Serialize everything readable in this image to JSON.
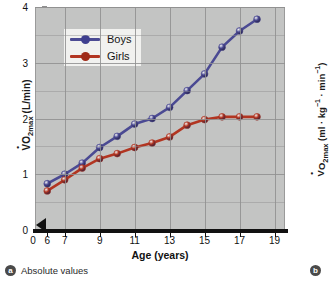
{
  "figure": {
    "panel_a": {
      "badge": "a",
      "caption": "Absolute values"
    },
    "panel_b": {
      "badge": "b",
      "ylabel_html": "V̇O<sub>2max</sub> (ml · kg<sup>−1</sup> · min<sup>−1</sup>)"
    }
  },
  "chart_data": {
    "type": "line",
    "title": "",
    "xlabel": "Age (years)",
    "ylabel": "VO2max (L/min)",
    "ylabel_html": "V̇O<sub>2max</sub> (L/min)",
    "xlim": [
      5.3,
      19.6
    ],
    "ylim": [
      0,
      4
    ],
    "xticks": [
      0,
      6,
      7,
      9,
      11,
      13,
      15,
      17,
      19
    ],
    "yticks": [
      0,
      1,
      2,
      3,
      4
    ],
    "grid": true,
    "axis_break": true,
    "legend_position": "upper-left-inside",
    "background": "#c3c4c3",
    "x": [
      6,
      7,
      8,
      9,
      10,
      11,
      12,
      13,
      14,
      15,
      16,
      17,
      18
    ],
    "series": [
      {
        "name": "Boys",
        "color": "#4b4a93",
        "values": [
          0.83,
          1.0,
          1.2,
          1.48,
          1.68,
          1.9,
          2.0,
          2.2,
          2.5,
          2.8,
          3.28,
          3.57,
          3.78
        ]
      },
      {
        "name": "Girls",
        "color": "#b23521",
        "values": [
          0.7,
          0.9,
          1.11,
          1.28,
          1.37,
          1.48,
          1.56,
          1.67,
          1.88,
          1.98,
          2.03,
          2.03,
          2.03
        ]
      }
    ]
  }
}
